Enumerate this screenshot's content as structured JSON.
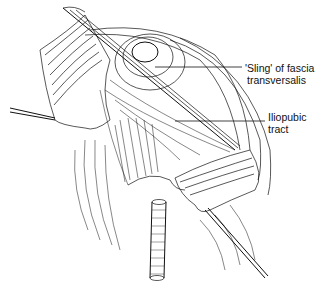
{
  "figure": {
    "colors": {
      "ink": "#111111",
      "background": "#ffffff"
    }
  },
  "labels": [
    {
      "line1": "'Sling' of fascia",
      "line2": "transversalis"
    },
    {
      "line1": "Iliopubic",
      "line2": "tract"
    }
  ]
}
